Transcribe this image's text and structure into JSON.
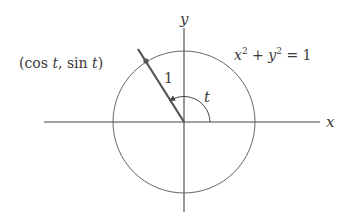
{
  "diagram": {
    "colors": {
      "axis": "#444444",
      "circle": "#666666",
      "radius": "#555555",
      "text": "#3a3a3a",
      "background": "#ffffff"
    },
    "geometry": {
      "origin": [
        184,
        122
      ],
      "circle_radius": 71,
      "angle_deg": 122,
      "arc_radius": 26
    },
    "labels": {
      "x_axis": "x",
      "y_axis": "y",
      "point": "(cos t, sin t)",
      "point_parts": {
        "open": "(cos ",
        "t1": "t",
        "mid": ", sin ",
        "t2": "t",
        "close": ")"
      },
      "radius": "1",
      "angle": "t",
      "equation": {
        "x": "x",
        "exp1": "2",
        "plus": " + ",
        "y": "y",
        "exp2": "2",
        "eq": " = 1"
      }
    }
  }
}
